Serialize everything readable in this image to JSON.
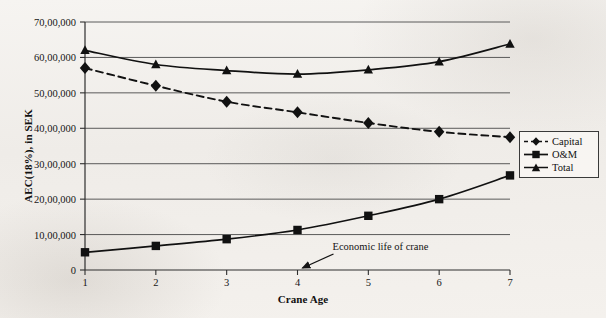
{
  "chart_data": {
    "type": "line",
    "title": "",
    "xlabel": "Crane Age",
    "ylabel": "AEC(18%), in SEK",
    "x": [
      1,
      2,
      3,
      4,
      5,
      6,
      7
    ],
    "xtick_labels": [
      "1",
      "2",
      "3",
      "4",
      "5",
      "6",
      "7"
    ],
    "xlim": [
      1,
      7
    ],
    "ylim": [
      0,
      7000000
    ],
    "ytick_values": [
      0,
      1000000,
      2000000,
      3000000,
      4000000,
      5000000,
      6000000,
      7000000
    ],
    "ytick_labels": [
      "0",
      "10,00,000",
      "20,00,000",
      "30,00,000",
      "40,00,000",
      "50,00,000",
      "60,00,000",
      "70,00,000"
    ],
    "grid": "horizontal",
    "legend_position": "center-right",
    "series": [
      {
        "name": "Capital",
        "marker": "diamond",
        "linestyle": "dashed",
        "color": "#111111",
        "values": [
          5700000,
          5200000,
          4750000,
          4450000,
          4150000,
          3900000,
          3750000
        ]
      },
      {
        "name": "O&M",
        "marker": "square",
        "linestyle": "solid",
        "color": "#111111",
        "values": [
          500000,
          680000,
          870000,
          1130000,
          1530000,
          2000000,
          2670000
        ]
      },
      {
        "name": "Total",
        "marker": "triangle",
        "linestyle": "solid",
        "color": "#111111",
        "values": [
          6200000,
          5800000,
          5630000,
          5530000,
          5650000,
          5880000,
          6380000
        ]
      }
    ],
    "annotations": [
      {
        "text": "Economic life of crane",
        "points_to_x": 4,
        "points_to_y": 0
      }
    ]
  },
  "legend": {
    "items": [
      {
        "label": "Capital"
      },
      {
        "label": "O&M"
      },
      {
        "label": "Total"
      }
    ]
  }
}
